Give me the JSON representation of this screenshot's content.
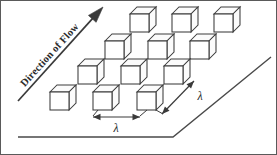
{
  "figure": {
    "width": 277,
    "height": 155,
    "background_color": "#ffffff",
    "border_color": "#5a5a5a",
    "line_color": "#3a3a3a",
    "cube_stroke_color": "#3c3c3c",
    "cube_fill_color": "#ffffff"
  },
  "flow_arrow": {
    "label": "Direction of Flow",
    "tail": {
      "x": 18,
      "y": 101
    },
    "tip": {
      "x": 103,
      "y": 7
    },
    "angle_deg": -47.8,
    "label_position": {
      "x": 52,
      "y": 57
    }
  },
  "dimensions": [
    {
      "name": "streamwise-spacing",
      "symbol": "λ",
      "orientation": "horizontal",
      "start": {
        "x": 93,
        "y": 117
      },
      "end": {
        "x": 140,
        "y": 117
      },
      "label_position": {
        "x": 116,
        "y": 132
      }
    },
    {
      "name": "spanwise-spacing",
      "symbol": "λ",
      "orientation": "diagonal",
      "start": {
        "x": 162,
        "y": 114
      },
      "end": {
        "x": 194,
        "y": 81
      },
      "label_position": {
        "x": 200,
        "y": 100
      }
    }
  ],
  "ground_plane": {
    "name": "inclined-plane-edge",
    "baseline_start": {
      "x": 18,
      "y": 137
    },
    "baseline_end": {
      "x": 173,
      "y": 137
    },
    "incline_end": {
      "x": 271,
      "y": 57
    }
  },
  "cube_geometry": {
    "face_width": 19,
    "face_height": 18,
    "depth_x": 7,
    "depth_y": 7
  },
  "cubes": [
    {
      "id": "cube-r1-c1",
      "row": 1,
      "col": 1,
      "x": 130,
      "y": 14
    },
    {
      "id": "cube-r1-c2",
      "row": 1,
      "col": 2,
      "x": 172,
      "y": 14
    },
    {
      "id": "cube-r1-c3",
      "row": 1,
      "col": 3,
      "x": 214,
      "y": 14
    },
    {
      "id": "cube-r2-c1",
      "row": 2,
      "col": 1,
      "x": 105,
      "y": 41
    },
    {
      "id": "cube-r2-c2",
      "row": 2,
      "col": 2,
      "x": 148,
      "y": 41
    },
    {
      "id": "cube-r2-c3",
      "row": 2,
      "col": 3,
      "x": 190,
      "y": 41
    },
    {
      "id": "cube-r3-c1",
      "row": 3,
      "col": 1,
      "x": 78,
      "y": 66
    },
    {
      "id": "cube-r3-c2",
      "row": 3,
      "col": 2,
      "x": 121,
      "y": 66
    },
    {
      "id": "cube-r3-c3",
      "row": 3,
      "col": 3,
      "x": 164,
      "y": 66
    },
    {
      "id": "cube-r4-c1",
      "row": 4,
      "col": 1,
      "x": 50,
      "y": 92
    },
    {
      "id": "cube-r4-c2",
      "row": 4,
      "col": 2,
      "x": 93,
      "y": 92
    },
    {
      "id": "cube-r4-c3",
      "row": 4,
      "col": 3,
      "x": 137,
      "y": 92
    }
  ],
  "leaders": [
    {
      "name": "leader-left-lambda-start",
      "from": {
        "x": 98,
        "y": 110
      },
      "to": {
        "x": 93,
        "y": 116
      }
    },
    {
      "name": "leader-left-lambda-end",
      "from": {
        "x": 147,
        "y": 110
      },
      "to": {
        "x": 140,
        "y": 116
      }
    },
    {
      "name": "leader-right-lambda",
      "from": {
        "x": 156,
        "y": 110
      },
      "to": {
        "x": 163,
        "y": 114
      }
    }
  ]
}
